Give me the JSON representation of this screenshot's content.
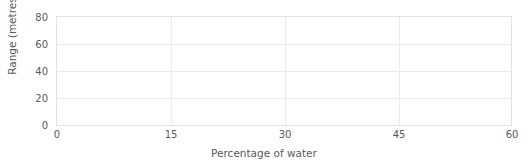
{
  "chart_data": {
    "type": "line",
    "title": "Water Bottle Rockets",
    "xlabel": "Percentage of water",
    "ylabel": "Range (metres)",
    "xlim": [
      0,
      60
    ],
    "ylim": [
      0,
      80
    ],
    "xticks": [
      0,
      15,
      30,
      45,
      60
    ],
    "yticks": [
      0,
      20,
      40,
      60,
      80
    ],
    "xtick_labels": [
      "0",
      "15",
      "30",
      "45",
      "60"
    ],
    "ytick_labels": [
      "0",
      "20",
      "40",
      "60",
      "80"
    ],
    "grid": true,
    "legend": null,
    "series": [],
    "x": [],
    "values": [],
    "note": "Empty plotting grid - no data points plotted"
  },
  "style": {
    "grid_color": "#eaeaec",
    "frame_color": "#e2e2e4",
    "text_color": "#59595b",
    "title_color": "#3f3f41",
    "background": "#ffffff"
  }
}
